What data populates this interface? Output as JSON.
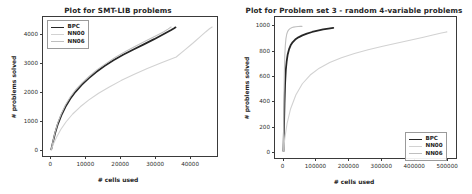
{
  "figure": {
    "width": 472,
    "height": 194,
    "background": "#ffffff"
  },
  "chart_data": [
    {
      "type": "line",
      "panel": "left",
      "title": "Plot for SMT-LIB problems",
      "xlabel": "# cells used",
      "ylabel": "# problems solved",
      "xlim": [
        -2400,
        48000
      ],
      "ylim": [
        -230,
        4600
      ],
      "xticks": [
        0,
        10000,
        20000,
        30000,
        40000
      ],
      "xticklabels": [
        "0",
        "10000",
        "20000",
        "30000",
        "40000"
      ],
      "yticks": [
        0,
        1000,
        2000,
        3000,
        4000
      ],
      "yticklabels": [
        "0",
        "1000",
        "2000",
        "3000",
        "4000"
      ],
      "grid": false,
      "legend_position": "upper left",
      "series": [
        {
          "name": "BPC",
          "color": "#262626",
          "width": 1.8,
          "points": [
            [
              0,
              0
            ],
            [
              500,
              260
            ],
            [
              1100,
              560
            ],
            [
              1900,
              880
            ],
            [
              2900,
              1180
            ],
            [
              4100,
              1480
            ],
            [
              5500,
              1760
            ],
            [
              7000,
              2000
            ],
            [
              8800,
              2240
            ],
            [
              10800,
              2470
            ],
            [
              13000,
              2690
            ],
            [
              15400,
              2900
            ],
            [
              18000,
              3100
            ],
            [
              20800,
              3290
            ],
            [
              23800,
              3470
            ],
            [
              26800,
              3650
            ],
            [
              29800,
              3830
            ],
            [
              32600,
              4010
            ],
            [
              34600,
              4140
            ],
            [
              35600,
              4210
            ],
            [
              36000,
              4240
            ]
          ]
        },
        {
          "name": "NN00",
          "color": "#d2d2d2",
          "width": 1.1,
          "points": [
            [
              0,
              0
            ],
            [
              700,
              210
            ],
            [
              1600,
              440
            ],
            [
              2800,
              700
            ],
            [
              4300,
              960
            ],
            [
              6200,
              1230
            ],
            [
              8400,
              1480
            ],
            [
              10900,
              1720
            ],
            [
              13700,
              1950
            ],
            [
              16800,
              2170
            ],
            [
              20200,
              2390
            ],
            [
              23900,
              2600
            ],
            [
              27800,
              2810
            ],
            [
              31900,
              3010
            ],
            [
              36200,
              3210
            ],
            [
              38600,
              3450
            ],
            [
              40900,
              3680
            ],
            [
              43000,
              3900
            ],
            [
              44700,
              4080
            ],
            [
              45900,
              4200
            ],
            [
              46600,
              4250
            ]
          ]
        },
        {
          "name": "NN06",
          "color": "#bfbfbf",
          "width": 1.1,
          "points": [
            [
              0,
              0
            ],
            [
              500,
              280
            ],
            [
              1100,
              600
            ],
            [
              1900,
              930
            ],
            [
              2900,
              1240
            ],
            [
              4100,
              1540
            ],
            [
              5500,
              1820
            ],
            [
              7100,
              2080
            ],
            [
              9000,
              2320
            ],
            [
              11100,
              2550
            ],
            [
              13400,
              2780
            ],
            [
              15900,
              2990
            ],
            [
              18600,
              3200
            ],
            [
              21500,
              3400
            ],
            [
              24500,
              3590
            ],
            [
              27600,
              3780
            ],
            [
              30500,
              3960
            ],
            [
              32600,
              4090
            ],
            [
              33800,
              4180
            ],
            [
              34400,
              4230
            ],
            [
              34700,
              4250
            ]
          ]
        }
      ]
    },
    {
      "type": "line",
      "panel": "right",
      "title": "Plot for Problem set 3 - random 4-variable problems",
      "xlabel": "# cells used",
      "ylabel": "# problems solved",
      "xlim": [
        -26000,
        530000
      ],
      "ylim": [
        -55,
        1075
      ],
      "xticks": [
        0,
        100000,
        200000,
        300000,
        400000,
        500000
      ],
      "xticklabels": [
        "0",
        "100000",
        "200000",
        "300000",
        "400000",
        "500000"
      ],
      "yticks": [
        0,
        200,
        400,
        600,
        800,
        1000
      ],
      "yticklabels": [
        "0",
        "200",
        "400",
        "600",
        "800",
        "1000"
      ],
      "grid": false,
      "legend_position": "lower right",
      "series": [
        {
          "name": "BPC",
          "color": "#262626",
          "width": 1.8,
          "points": [
            [
              0,
              0
            ],
            [
              1500,
              180
            ],
            [
              3200,
              380
            ],
            [
              5000,
              540
            ],
            [
              7200,
              650
            ],
            [
              9800,
              720
            ],
            [
              13000,
              775
            ],
            [
              17000,
              815
            ],
            [
              22000,
              848
            ],
            [
              28000,
              872
            ],
            [
              36000,
              894
            ],
            [
              46000,
              912
            ],
            [
              58000,
              928
            ],
            [
              72000,
              942
            ],
            [
              88000,
              955
            ],
            [
              105000,
              966
            ],
            [
              122000,
              975
            ],
            [
              138000,
              982
            ],
            [
              148000,
              986
            ],
            [
              153000,
              988
            ]
          ]
        },
        {
          "name": "NN00",
          "color": "#d2d2d2",
          "width": 1.1,
          "points": [
            [
              0,
              0
            ],
            [
              4000,
              100
            ],
            [
              11000,
              220
            ],
            [
              22000,
              340
            ],
            [
              38000,
              450
            ],
            [
              58000,
              540
            ],
            [
              82000,
              610
            ],
            [
              110000,
              665
            ],
            [
              142000,
              710
            ],
            [
              178000,
              748
            ],
            [
              218000,
              782
            ],
            [
              260000,
              812
            ],
            [
              305000,
              840
            ],
            [
              350000,
              866
            ],
            [
              392000,
              890
            ],
            [
              430000,
              912
            ],
            [
              462000,
              932
            ],
            [
              485000,
              946
            ],
            [
              497000,
              953
            ],
            [
              502000,
              956
            ]
          ]
        },
        {
          "name": "NN06",
          "color": "#bfbfbf",
          "width": 1.1,
          "points": [
            [
              0,
              0
            ],
            [
              700,
              220
            ],
            [
              1600,
              450
            ],
            [
              2700,
              630
            ],
            [
              4000,
              760
            ],
            [
              5600,
              845
            ],
            [
              7500,
              900
            ],
            [
              9800,
              935
            ],
            [
              12600,
              958
            ],
            [
              16000,
              972
            ],
            [
              20000,
              982
            ],
            [
              25000,
              989
            ],
            [
              31000,
              994
            ],
            [
              38000,
              997
            ],
            [
              45000,
              999
            ],
            [
              52000,
              1000
            ],
            [
              57000,
              1000
            ]
          ]
        }
      ]
    }
  ]
}
